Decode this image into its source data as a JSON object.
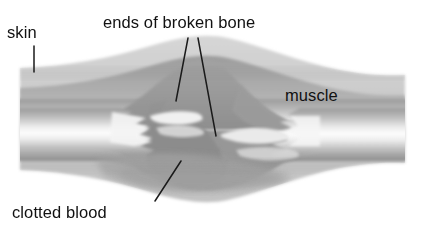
{
  "figure": {
    "background_color": "#ffffff",
    "width": 425,
    "height": 237
  },
  "labels": [
    {
      "id": "skin",
      "text": "skin",
      "leader": "vertical-line-down"
    },
    {
      "id": "ends_of_broken_bone",
      "text": "ends of broken bone",
      "leader": "two-lines-down"
    },
    {
      "id": "muscle",
      "text": "muscle",
      "leader": "none"
    },
    {
      "id": "clotted_blood",
      "text": "clotted blood",
      "leader": "diagonal-line-up-right"
    }
  ],
  "structures": [
    {
      "name": "skin",
      "tone": "light-gray",
      "color": "#c9c9c9"
    },
    {
      "name": "muscle",
      "tone": "medium-gray",
      "color": "#a8a8a8"
    },
    {
      "name": "bone",
      "tone": "white-highlight",
      "color": "#f2f2f2"
    },
    {
      "name": "clotted blood",
      "tone": "dark-gray",
      "color": "#8f8f8f"
    },
    {
      "name": "broken bone ends",
      "tone": "bright-jagged",
      "color": "#efefef"
    }
  ],
  "colors": {
    "ink": "#111111",
    "skin": "#c9c9c9",
    "muscle": "#a3a3a3",
    "muscle_dark": "#949494",
    "clot": "#8d8d8d",
    "bone_light": "#fbfbfb",
    "bone_mid": "#cdcdcd",
    "paper": "#ffffff"
  }
}
